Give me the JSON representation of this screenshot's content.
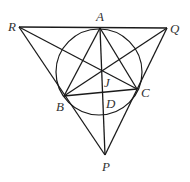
{
  "figure": {
    "points": {
      "A": {
        "label": "A",
        "x": 100,
        "y": 28,
        "lx": 96,
        "ly": 21
      },
      "Q": {
        "label": "Q",
        "x": 167,
        "y": 28,
        "lx": 170,
        "ly": 33
      },
      "R": {
        "label": "R",
        "x": 19,
        "y": 27,
        "lx": 8,
        "ly": 31
      },
      "B": {
        "label": "B",
        "x": 64,
        "y": 96,
        "lx": 56,
        "ly": 111
      },
      "C": {
        "label": "C",
        "x": 137,
        "y": 89,
        "lx": 141,
        "ly": 97
      },
      "J": {
        "label": "J",
        "x": 102,
        "y": 71,
        "lx": 104,
        "ly": 87
      },
      "D": {
        "label": "D",
        "x": 104,
        "y": 93,
        "lx": 106,
        "ly": 108
      },
      "P": {
        "label": "P",
        "x": 105,
        "y": 155,
        "lx": 102,
        "ly": 171
      }
    },
    "circle": {
      "cx": 99,
      "cy": 72,
      "r": 43
    },
    "segments": [
      [
        "R",
        "Q"
      ],
      [
        "R",
        "P"
      ],
      [
        "Q",
        "P"
      ],
      [
        "A",
        "B"
      ],
      [
        "A",
        "C"
      ],
      [
        "B",
        "C"
      ],
      [
        "A",
        "P"
      ],
      [
        "R",
        "C"
      ],
      [
        "Q",
        "B"
      ]
    ],
    "stroke_color": "#1a1a1a"
  }
}
